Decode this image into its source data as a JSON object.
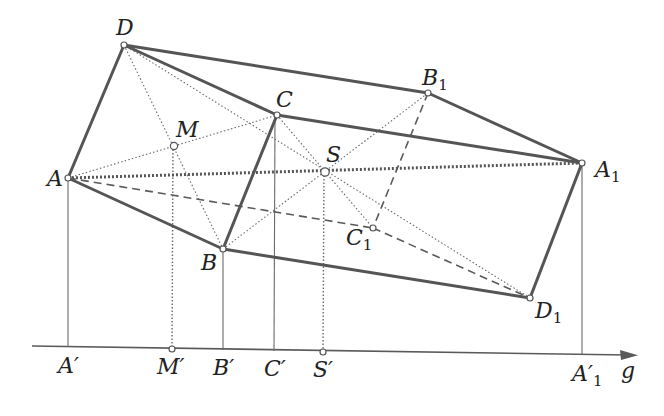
{
  "figure": {
    "axis_label": "g",
    "points": {
      "A": {
        "label": "A",
        "sub": "",
        "x": 68,
        "y": 178
      },
      "B": {
        "label": "B",
        "sub": "",
        "x": 223,
        "y": 249
      },
      "C": {
        "label": "C",
        "sub": "",
        "x": 277,
        "y": 115
      },
      "D": {
        "label": "D",
        "sub": "",
        "x": 124,
        "y": 45
      },
      "M": {
        "label": "M",
        "sub": "",
        "x": 174,
        "y": 146
      },
      "S": {
        "label": "S",
        "sub": "",
        "x": 325,
        "y": 172
      },
      "A1": {
        "label": "A",
        "sub": "1",
        "x": 582,
        "y": 163
      },
      "B1": {
        "label": "B",
        "sub": "1",
        "x": 428,
        "y": 93
      },
      "C1": {
        "label": "C",
        "sub": "1",
        "x": 373,
        "y": 228
      },
      "D1": {
        "label": "D",
        "sub": "1",
        "x": 530,
        "y": 298
      }
    },
    "projections": {
      "A_prime": {
        "label": "A′",
        "sub": "",
        "x": 68,
        "y": 347
      },
      "M_prime": {
        "label": "M′",
        "sub": "",
        "x": 172,
        "y": 349
      },
      "B_prime": {
        "label": "B′",
        "sub": "",
        "x": 223,
        "y": 350
      },
      "C_prime": {
        "label": "C′",
        "sub": "",
        "x": 274,
        "y": 351
      },
      "S_prime": {
        "label": "S′",
        "sub": "",
        "x": 323,
        "y": 352
      },
      "A1_prime": {
        "label": "A′",
        "sub": "1",
        "x": 582,
        "y": 355
      }
    },
    "labels": {
      "A": "A",
      "B": "B",
      "C": "C",
      "D": "D",
      "M": "M",
      "S": "S",
      "A1_main": "A",
      "A1_sub": "1",
      "B1_main": "B",
      "B1_sub": "1",
      "C1_main": "C",
      "C1_sub": "1",
      "D1_main": "D",
      "D1_sub": "1",
      "A_prime": "A′",
      "M_prime": "M′",
      "B_prime": "B′",
      "C_prime": "C′",
      "S_prime": "S′",
      "A1_prime_main": "A′",
      "A1_prime_sub": "1",
      "axis": "g"
    },
    "edges": {
      "solid": [
        "D-B1",
        "B1-A1",
        "D-C",
        "C-A1",
        "A-D",
        "A-B",
        "C-B",
        "B-D1",
        "D1-A1"
      ],
      "dashed": [
        "A-C1",
        "C1-D1",
        "B1-C1"
      ],
      "dotted_thick": [
        "A-A1"
      ],
      "dotted_thin": [
        "D-D1",
        "C-C1",
        "B-B1",
        "A-C",
        "D-B",
        "M-M'",
        "S-S'"
      ],
      "projection_solid": [
        "A-A'",
        "B-B'",
        "C-C'",
        "A1-A1'"
      ]
    },
    "colors": {
      "line": "#555555",
      "background": "#ffffff",
      "text": "#222222"
    }
  }
}
